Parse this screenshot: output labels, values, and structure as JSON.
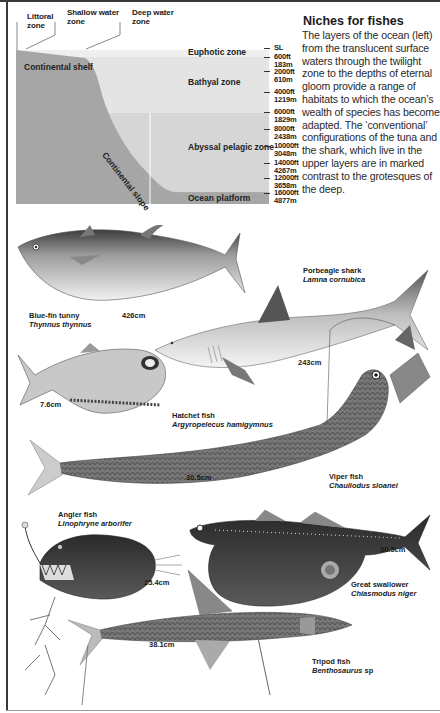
{
  "diagram": {
    "top_labels": [
      {
        "line1": "Littoral",
        "line2": "zone"
      },
      {
        "line1": "Shallow water",
        "line2": "zone"
      },
      {
        "line1": "Deep water",
        "line2": "zone"
      }
    ],
    "continental_shelf": "Continental shelf",
    "continental_slope": "Continental slope",
    "zones": [
      "Euphotic zone",
      "Bathyal zone",
      "Abyssal pelagic zone",
      "Ocean platform"
    ],
    "depths": [
      {
        "ft": "SL",
        "m": ""
      },
      {
        "ft": "600ft",
        "m": "183m"
      },
      {
        "ft": "2000ft",
        "m": "610m"
      },
      {
        "ft": "4000ft",
        "m": "1219m"
      },
      {
        "ft": "6000ft",
        "m": "1829m"
      },
      {
        "ft": "8000ft",
        "m": "2438m"
      },
      {
        "ft": "10000ft",
        "m": "3048m"
      },
      {
        "ft": "14000ft",
        "m": "4267m"
      },
      {
        "ft": "12000ft",
        "m": "3658m"
      },
      {
        "ft": "16000ft",
        "m": "4877m"
      }
    ],
    "colors": {
      "land": "#a6a6a6",
      "euphotic": "#ececec",
      "bathyal": "#e2e2e2",
      "abyssal": "#d4d4d4",
      "platform": "#a9a9a9"
    }
  },
  "article": {
    "title": "Niches for fishes",
    "body": "The layers of the ocean (left) from the translucent surface waters through the twilight zone to the depths of eternal gloom provide a range of habitats to which the ocean’s wealth of species has become adapted. The ‘conventional’ configurations of the tuna and the shark, which live in the upper layers are in marked contrast to the grotesques of the deep."
  },
  "fishes": [
    {
      "name": "Blue-fin tunny",
      "scientific": "Thynnus thynnus",
      "size": "426cm"
    },
    {
      "name": "Porbeagle shark",
      "scientific": "Lamna cornubica",
      "size": "243cm"
    },
    {
      "name": "Hatchet fish",
      "scientific": "Argyropelecus hamigymnus",
      "size": "7.6cm"
    },
    {
      "name": "Viper fish",
      "scientific": "Chauliodus sloanei",
      "size": "30.5cm"
    },
    {
      "name": "Angler fish",
      "scientific": "Linophryne arborifer",
      "size": "25.4cm"
    },
    {
      "name": "Great swallower",
      "scientific": "Chiasmodus niger",
      "size": "30.5cm"
    },
    {
      "name": "Tripod fish",
      "scientific": "Benthosaurus",
      "scientific_suffix": "sp",
      "size": "38.1cm"
    }
  ]
}
